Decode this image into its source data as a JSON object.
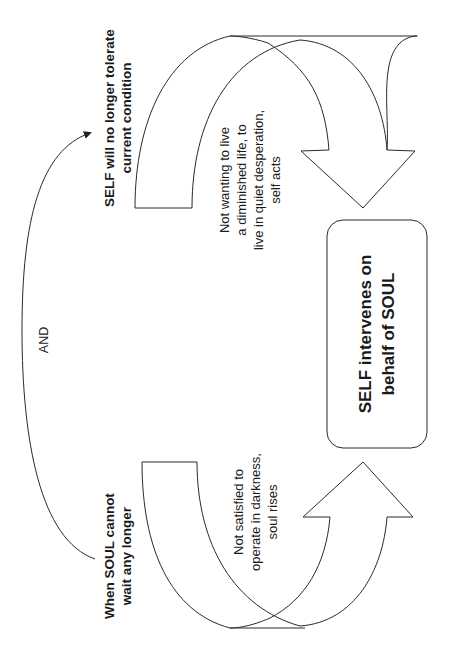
{
  "diagram": {
    "orientation": "rotated -90deg",
    "colors": {
      "stroke": "#2a2a2a",
      "text": "#1a1a1a",
      "background": "#ffffff"
    },
    "nodes": {
      "self_tolerate": {
        "lines": [
          "SELF will no longer tolerate",
          "current condition"
        ],
        "weight": "bold"
      },
      "soul_wait": {
        "lines": [
          "When SOUL cannot",
          "wait any longer"
        ],
        "weight": "bold"
      },
      "and_label": {
        "text": "AND"
      },
      "not_wanting": {
        "lines": [
          "Not wanting to live",
          "a diminished life, to",
          "live in quiet desperation,",
          "self acts"
        ]
      },
      "not_satisfied": {
        "lines": [
          "Not satisfied to",
          "operate in darkness,",
          "soul rises"
        ]
      },
      "center_box": {
        "lines": [
          "SELF intervenes on",
          "behalf of SOUL"
        ],
        "weight": "bold"
      }
    },
    "edges": [
      {
        "from": "soul_wait",
        "to": "self_tolerate",
        "label": "AND",
        "style": "curved connector with arrowhead"
      },
      {
        "from": "self_tolerate",
        "to": "center_box",
        "label": "Not wanting to live a diminished life, to live in quiet desperation, self acts",
        "style": "block curved arrow"
      },
      {
        "from": "soul_wait",
        "to": "center_box",
        "label": "Not satisfied to operate in darkness, soul rises",
        "style": "block curved arrow"
      }
    ]
  }
}
